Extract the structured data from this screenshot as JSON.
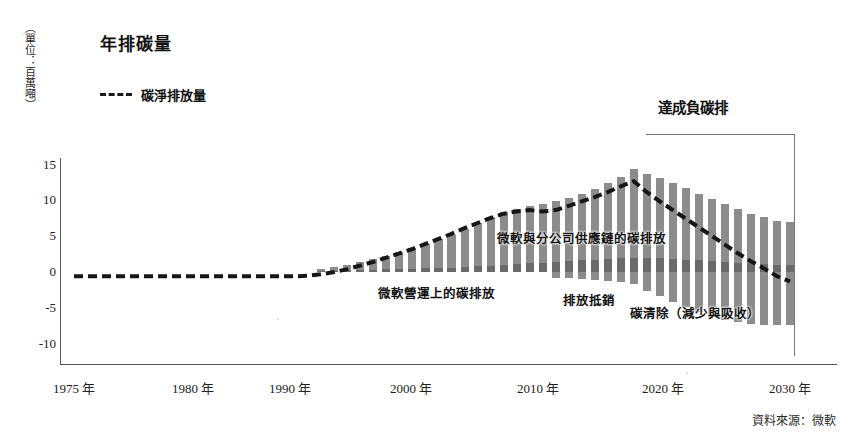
{
  "chart": {
    "title": "年排碳量",
    "y_axis_label": "（單位：百萬噸）",
    "source_note": "資料來源：微軟"
  },
  "legend": {
    "net_emissions": "碳淨排放量"
  },
  "annotations": {
    "operations": "微軟營運上的碳排放",
    "supply_chain": "微軟與分公司供應鏈的碳排放",
    "offsets": "排放抵銷",
    "removal": "碳清除（減少與吸收）",
    "negative_goal": "達成負碳排"
  },
  "chart_data": {
    "type": "bar",
    "title": "年排碳量",
    "xlabel": "",
    "ylabel": "（單位：百萬噸）",
    "ylim": [
      -12,
      17
    ],
    "yticks": [
      15,
      10,
      5,
      0,
      -5,
      -10
    ],
    "ytick_labels": [
      "15",
      "10",
      "5",
      "0",
      "-5",
      "-10"
    ],
    "xticks": [
      1975,
      1980,
      1990,
      2000,
      2010,
      2020,
      2030
    ],
    "xtick_labels": [
      "1975 年",
      "1980 年",
      "1990 年",
      "2000 年",
      "2010 年",
      "2020 年",
      "2030 年"
    ],
    "grid": false,
    "legend_position": "top-left",
    "x": [
      1975,
      1976,
      1977,
      1978,
      1979,
      1980,
      1981,
      1982,
      1983,
      1984,
      1985,
      1986,
      1987,
      1988,
      1989,
      1990,
      1991,
      1992,
      1993,
      1994,
      1995,
      1996,
      1997,
      1998,
      1999,
      2000,
      2001,
      2002,
      2003,
      2004,
      2005,
      2006,
      2007,
      2008,
      2009,
      2010,
      2011,
      2012,
      2013,
      2014,
      2015,
      2016,
      2017,
      2018,
      2019,
      2020,
      2021,
      2022,
      2023,
      2024,
      2025,
      2026,
      2027,
      2028,
      2029,
      2030
    ],
    "series": [
      {
        "name": "微軟營運上的碳排放",
        "note": "darker band at base of each bar",
        "values": [
          0,
          0,
          0,
          0,
          0,
          0,
          0,
          0,
          0,
          0,
          0,
          0,
          0,
          0,
          0,
          0,
          0,
          0,
          0,
          0.1,
          0.15,
          0.2,
          0.25,
          0.3,
          0.35,
          0.4,
          0.45,
          0.5,
          0.55,
          0.6,
          0.7,
          0.8,
          0.9,
          1.0,
          1.1,
          1.2,
          1.3,
          1.4,
          1.5,
          1.6,
          1.7,
          1.8,
          1.9,
          2.0,
          2.0,
          1.9,
          1.8,
          1.7,
          1.6,
          1.5,
          1.4,
          1.3,
          1.2,
          1.1,
          1.0,
          1.0
        ]
      },
      {
        "name": "微軟與分公司供應鏈的碳排放",
        "note": "light grey bar body above zero",
        "values": [
          0,
          0,
          0,
          0,
          0,
          0,
          0,
          0,
          0,
          0,
          0,
          0,
          0,
          0,
          0,
          0,
          0,
          0,
          0,
          0.3,
          0.5,
          0.8,
          1.1,
          1.5,
          1.9,
          2.4,
          2.9,
          3.4,
          4.0,
          4.6,
          5.3,
          6.0,
          6.7,
          7.3,
          7.7,
          8.0,
          8.2,
          8.4,
          8.8,
          9.3,
          9.8,
          10.5,
          11.3,
          12.3,
          11.6,
          11.2,
          10.6,
          9.9,
          9.2,
          8.6,
          8.0,
          7.4,
          6.9,
          6.5,
          6.1,
          6.0
        ]
      },
      {
        "name": "排放抵銷 / 碳清除（減少與吸收）",
        "note": "grey bar extending below zero",
        "values": [
          0,
          0,
          0,
          0,
          0,
          0,
          0,
          0,
          0,
          0,
          0,
          0,
          0,
          0,
          0,
          0,
          0,
          0,
          0,
          0,
          0,
          0,
          0,
          0,
          0,
          0,
          0,
          0,
          0,
          0,
          0,
          0,
          0,
          0,
          0,
          0,
          0,
          -0.8,
          -0.9,
          -1.0,
          -1.1,
          -1.2,
          -1.4,
          -1.6,
          -2.6,
          -3.4,
          -4.2,
          -4.9,
          -5.6,
          -6.2,
          -6.7,
          -7.0,
          -7.2,
          -7.3,
          -7.4,
          -7.4
        ]
      },
      {
        "name": "碳淨排放量",
        "note": "dashed net emissions line",
        "style": "dashed",
        "values": [
          -0.6,
          -0.6,
          -0.6,
          -0.6,
          -0.6,
          -0.6,
          -0.6,
          -0.6,
          -0.6,
          -0.6,
          -0.6,
          -0.6,
          -0.6,
          -0.6,
          -0.6,
          -0.6,
          -0.6,
          -0.6,
          -0.5,
          -0.3,
          0.0,
          0.4,
          0.9,
          1.4,
          2.0,
          2.6,
          3.2,
          3.9,
          4.6,
          5.3,
          6.1,
          6.8,
          7.5,
          8.1,
          8.4,
          8.6,
          8.4,
          8.6,
          9.2,
          9.8,
          10.4,
          11.1,
          11.9,
          12.6,
          11.1,
          9.8,
          8.6,
          7.4,
          6.2,
          5.0,
          3.8,
          2.6,
          1.5,
          0.5,
          -0.6,
          -1.3
        ]
      }
    ]
  }
}
